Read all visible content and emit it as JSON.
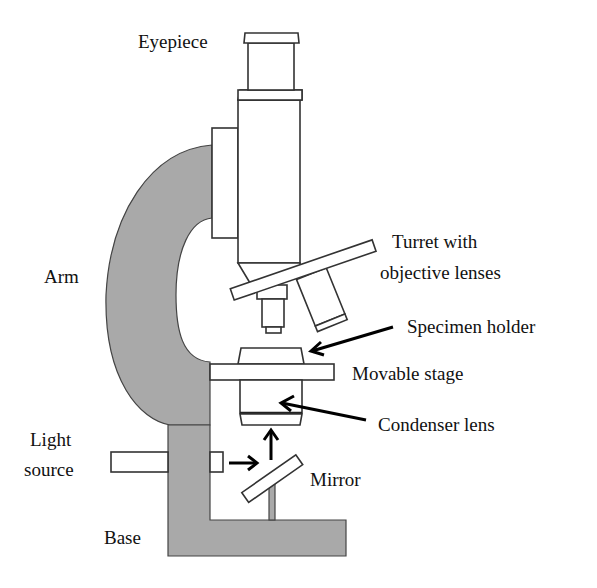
{
  "diagram": {
    "colors": {
      "body_gray": "#a9a9a9",
      "outline": "#333333",
      "text": "#111111",
      "background": "#ffffff"
    },
    "labels": {
      "eyepiece": "Eyepiece",
      "turret_line1": "Turret with",
      "turret_line2": "objective lenses",
      "specimen_holder": "Specimen holder",
      "movable_stage": "Movable stage",
      "arm": "Arm",
      "condenser_lens": "Condenser lens",
      "light_line1": "Light",
      "light_line2": "source",
      "mirror": "Mirror",
      "base": "Base"
    }
  }
}
